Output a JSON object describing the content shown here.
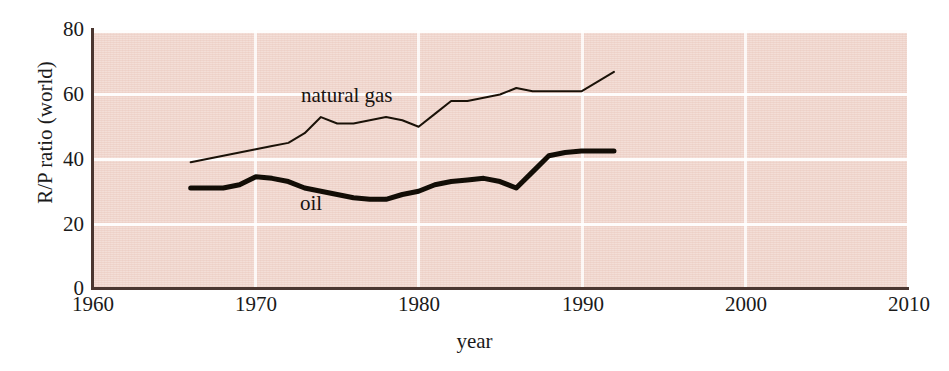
{
  "chart_data": {
    "type": "line",
    "title": "",
    "xlabel": "year",
    "ylabel": "R/P ratio (world)",
    "xlim": [
      1960,
      2010
    ],
    "ylim": [
      0,
      80
    ],
    "xticks": [
      "1960",
      "1970",
      "1980",
      "1990",
      "2000",
      "2010"
    ],
    "yticks": [
      "0",
      "20",
      "40",
      "60",
      "80"
    ],
    "grid": true,
    "legend_position": "inline-annotations",
    "background_color": "#f3ded7",
    "line_color": "#1a1208",
    "series": [
      {
        "name": "natural gas",
        "label_text": "natural gas",
        "line_weight": "thin",
        "x": [
          1966,
          1967,
          1968,
          1969,
          1970,
          1971,
          1972,
          1973,
          1974,
          1975,
          1976,
          1977,
          1978,
          1979,
          1980,
          1981,
          1982,
          1983,
          1984,
          1985,
          1986,
          1987,
          1988,
          1989,
          1990,
          1991,
          1992
        ],
        "values": [
          39,
          40,
          41,
          42,
          43,
          44,
          45,
          48,
          53,
          51,
          51,
          52,
          53,
          52,
          50,
          54,
          58,
          58,
          59,
          60,
          62,
          61,
          61,
          61,
          61,
          64,
          67
        ]
      },
      {
        "name": "oil",
        "label_text": "oil",
        "line_weight": "thick",
        "x": [
          1966,
          1967,
          1968,
          1969,
          1970,
          1971,
          1972,
          1973,
          1974,
          1975,
          1976,
          1977,
          1978,
          1979,
          1980,
          1981,
          1982,
          1983,
          1984,
          1985,
          1986,
          1987,
          1988,
          1989,
          1990,
          1991,
          1992
        ],
        "values": [
          31,
          31,
          31,
          32,
          34.5,
          34,
          33,
          31,
          30,
          29,
          28,
          27.5,
          27.5,
          29,
          30,
          32,
          33,
          33.5,
          34,
          33,
          31,
          36,
          41,
          42,
          42.5,
          42.5,
          42.5
        ]
      }
    ]
  },
  "axes": {
    "y_title": "R/P ratio (world)",
    "x_title": "year",
    "y_ticks": [
      {
        "value": 80,
        "label": "80"
      },
      {
        "value": 60,
        "label": "60"
      },
      {
        "value": 40,
        "label": "40"
      },
      {
        "value": 20,
        "label": "20"
      },
      {
        "value": 0,
        "label": "0"
      }
    ],
    "x_ticks": [
      {
        "value": 1960,
        "label": "1960"
      },
      {
        "value": 1970,
        "label": "1970"
      },
      {
        "value": 1980,
        "label": "1980"
      },
      {
        "value": 1990,
        "label": "1990"
      },
      {
        "value": 2000,
        "label": "2000"
      },
      {
        "value": 2010,
        "label": "2010"
      }
    ]
  },
  "annotations": {
    "natural_gas": "natural gas",
    "oil": "oil"
  },
  "caption_sliver": ""
}
